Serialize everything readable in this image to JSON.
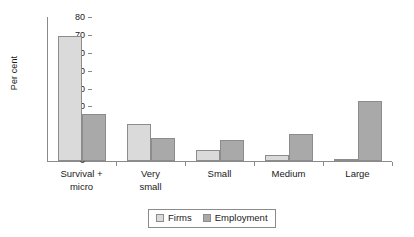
{
  "chart_data": {
    "type": "bar",
    "title": "",
    "xlabel": "",
    "ylabel": "Per cent",
    "ylim": [
      0,
      80
    ],
    "ytick_labels": [
      "80",
      "70",
      "60",
      "50",
      "40",
      "30",
      "20",
      "10",
      "0"
    ],
    "ytick_values": [
      80,
      70,
      60,
      50,
      40,
      30,
      20,
      10,
      0
    ],
    "grid": false,
    "legend_position": "bottom-center",
    "categories": [
      "Survival + micro",
      "Very small",
      "Small",
      "Medium",
      "Large"
    ],
    "category_lines": [
      [
        "Survival +",
        "micro"
      ],
      [
        "Very",
        "small"
      ],
      [
        "Small"
      ],
      [
        "Medium"
      ],
      [
        "Large"
      ]
    ],
    "series": [
      {
        "name": "Firms",
        "color": "#dadada",
        "values": [
          70,
          20.5,
          6,
          3.5,
          1
        ]
      },
      {
        "name": "Employment",
        "color": "#a9a9a9",
        "values": [
          26.5,
          13,
          12,
          15,
          33.5
        ]
      }
    ]
  },
  "axis": {
    "y_title": "Per cent"
  },
  "legend": {
    "entries": [
      {
        "label": "Firms",
        "swatch": "firms-swatch"
      },
      {
        "label": "Employment",
        "swatch": "employment-swatch"
      }
    ]
  },
  "colors": {
    "firms": "#dadada",
    "employment": "#a9a9a9",
    "axis": "#8a8a8a",
    "bar_border": "#8c8c8c",
    "text": "#1a1a1a",
    "background": "#ffffff"
  }
}
